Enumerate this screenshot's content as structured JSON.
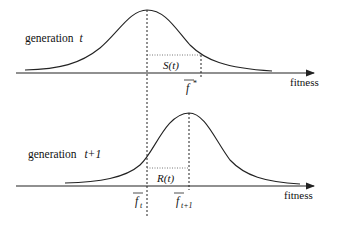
{
  "diagram": {
    "top": {
      "label_prefix": "generation",
      "label_var": "t",
      "axis_label": "fitness",
      "interval_label": "S(t)",
      "mean_label": "f",
      "mean_sup": "*"
    },
    "bottom": {
      "label_prefix": "generation",
      "label_var": "t+1",
      "axis_label": "fitness",
      "interval_label": "R(t)",
      "mean_t_label": "f",
      "mean_t_sub": "t",
      "mean_t1_label": "f",
      "mean_t1_sub": "t+1"
    },
    "colors": {
      "line": "#222222",
      "text": "#111111"
    }
  }
}
